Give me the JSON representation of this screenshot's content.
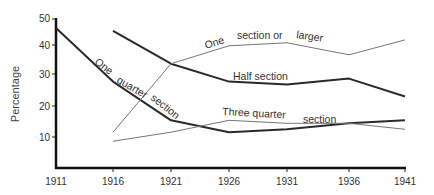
{
  "chart_data": {
    "type": "line",
    "title": "",
    "xlabel": "",
    "ylabel": "Percentage",
    "x": [
      1911,
      1916,
      1921,
      1926,
      1931,
      1936,
      1941
    ],
    "x_tick_labels": [
      "1911",
      "1916",
      "1921",
      "1926",
      "1931",
      "1936",
      "1941"
    ],
    "y_tick_labels": [
      "10",
      "20",
      "30",
      "40",
      "50"
    ],
    "yticks": [
      10,
      20,
      30,
      40,
      50
    ],
    "ylim": [
      0,
      50
    ],
    "xlim": [
      1911,
      1941
    ],
    "grid": false,
    "legend": "inline labels on lines",
    "series": [
      {
        "name": "One quarter section",
        "label_parts": [
          "One",
          "quarter",
          "section"
        ],
        "style": "thick",
        "color": "#2a2a2a",
        "x": [
          1911,
          1916,
          1921,
          1926,
          1931,
          1936,
          1941
        ],
        "values": [
          47,
          29,
          16,
          12,
          13,
          15,
          16
        ]
      },
      {
        "name": "Half section",
        "label_parts": [
          "Half section"
        ],
        "style": "thick",
        "color": "#2a2a2a",
        "x": [
          1916,
          1921,
          1926,
          1931,
          1936,
          1941
        ],
        "values": [
          46,
          35,
          29,
          28,
          30,
          24
        ]
      },
      {
        "name": "One section or larger",
        "label_parts": [
          "One",
          "section or",
          "larger"
        ],
        "style": "thin",
        "color": "#777777",
        "x": [
          1916,
          1921,
          1926,
          1931,
          1936,
          1941
        ],
        "values": [
          12,
          35,
          41,
          42,
          38,
          43
        ]
      },
      {
        "name": "Three quarter section",
        "label_parts": [
          "Three quarter",
          "section"
        ],
        "style": "thin",
        "color": "#777777",
        "x": [
          1916,
          1921,
          1926,
          1931,
          1936,
          1941
        ],
        "values": [
          9,
          12,
          16,
          15,
          15,
          13
        ]
      }
    ]
  },
  "labels": {
    "ylabel": "Percentage",
    "one_quarter": [
      "One",
      "quarter",
      "section"
    ],
    "half": "Half section",
    "one_section": [
      "One",
      "section or",
      "larger"
    ],
    "three_quarter": [
      "Three quarter",
      "section"
    ]
  }
}
